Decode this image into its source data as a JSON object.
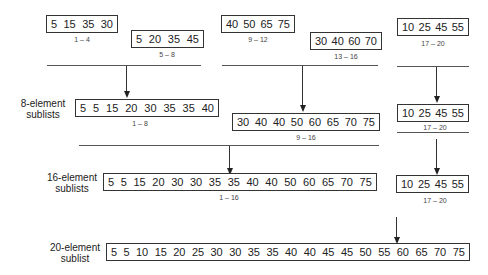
{
  "row1": {
    "sublists": [
      {
        "values": [
          "5",
          "15",
          "35",
          "30"
        ],
        "range": "1 – 4"
      },
      {
        "values": [
          "5",
          "20",
          "35",
          "45"
        ],
        "range": "5 – 8"
      },
      {
        "values": [
          "40",
          "50",
          "65",
          "75"
        ],
        "range": "9 – 12"
      },
      {
        "values": [
          "30",
          "40",
          "60",
          "70"
        ],
        "range": "13 – 16"
      },
      {
        "values": [
          "10",
          "25",
          "45",
          "55"
        ],
        "range": "17 – 20"
      }
    ]
  },
  "row2": {
    "label_line1": "8-element",
    "label_line2": "sublists",
    "sublists": [
      {
        "values": [
          "5",
          "5",
          "15",
          "20",
          "30",
          "35",
          "35",
          "40"
        ],
        "range": "1 – 8"
      },
      {
        "values": [
          "30",
          "40",
          "40",
          "50",
          "60",
          "65",
          "70",
          "75"
        ],
        "range": "9 – 16"
      },
      {
        "values": [
          "10",
          "25",
          "45",
          "55"
        ],
        "range": "17 – 20"
      }
    ]
  },
  "row3": {
    "label_line1": "16-element",
    "label_line2": "sublists",
    "sublists": [
      {
        "values": [
          "5",
          "5",
          "15",
          "20",
          "30",
          "30",
          "35",
          "35",
          "40",
          "40",
          "50",
          "60",
          "65",
          "70",
          "75"
        ],
        "range": "1 – 16"
      },
      {
        "values": [
          "10",
          "25",
          "45",
          "55"
        ],
        "range": "17 – 20"
      }
    ]
  },
  "row4": {
    "label_line1": "20-element",
    "label_line2": "sublist",
    "sublists": [
      {
        "values": [
          "5",
          "5",
          "10",
          "15",
          "20",
          "25",
          "30",
          "30",
          "35",
          "35",
          "40",
          "40",
          "45",
          "45",
          "50",
          "55",
          "60",
          "65",
          "70",
          "75"
        ]
      }
    ]
  }
}
